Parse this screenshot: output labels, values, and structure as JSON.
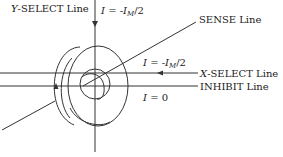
{
  "diagram": {
    "colors": {
      "line": "#333333",
      "background": "#ffffff"
    },
    "labels": {
      "y_select": {
        "var": "Y",
        "text": "-SELECT Line"
      },
      "y_current": {
        "lhs": "I",
        "eq": " = -",
        "sym": "I",
        "sub": "M",
        "tail": "/2"
      },
      "sense": {
        "text": "SENSE Line"
      },
      "x_current": {
        "lhs": "I",
        "eq": " = -",
        "sym": "I",
        "sub": "M",
        "tail": "/2"
      },
      "x_select": {
        "var": "X",
        "text": "-SELECT Line"
      },
      "inhibit": {
        "text": "INHIBIT Line"
      },
      "inhibit_current": {
        "lhs": "I",
        "eq": " = 0"
      }
    }
  }
}
